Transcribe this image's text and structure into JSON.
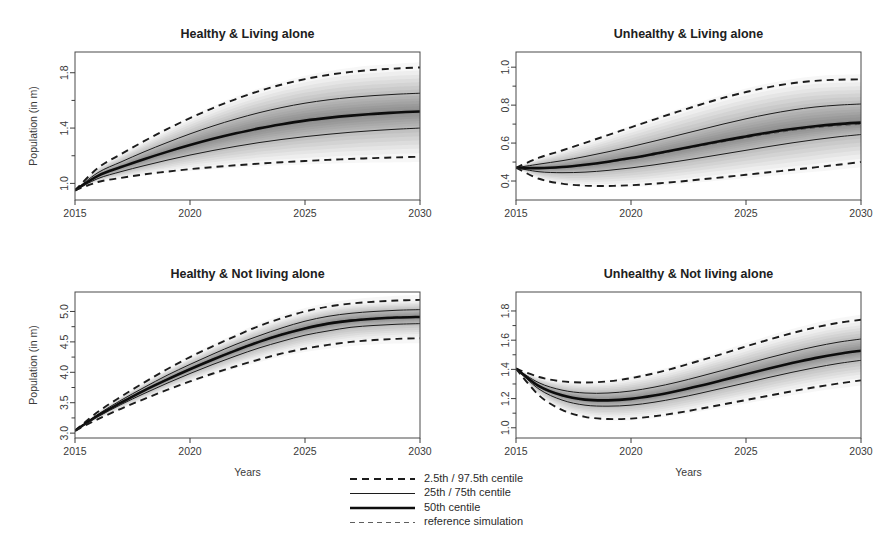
{
  "figure": {
    "width": 884,
    "height": 560,
    "background": "#ffffff",
    "ink": "#1a1a1a"
  },
  "axis_titles": {
    "y": "Population (in m)",
    "x": "Years"
  },
  "legend": {
    "items": [
      {
        "label": "2.5th / 97.5th centile",
        "style": "dashed-bold",
        "color": "#1c1c1c"
      },
      {
        "label": "25th / 75th centile",
        "style": "solid-thin",
        "color": "#1c1c1c"
      },
      {
        "label": "50th centile",
        "style": "solid-bold",
        "color": "#0d0d0d"
      },
      {
        "label": "reference simulation",
        "style": "dashed-thin",
        "color": "#6e6e6e"
      }
    ]
  },
  "chart_data": [
    {
      "id": "healthy-living-alone",
      "type": "line",
      "title": "Healthy & Living alone",
      "xlabel": "",
      "ylabel": "Population (in m)",
      "xlim": [
        2015,
        2030
      ],
      "ylim": [
        0.88,
        1.95
      ],
      "xticks": [
        2015,
        2020,
        2025,
        2030
      ],
      "yticks": [
        1.0,
        1.4,
        1.8
      ],
      "ytick_labels": [
        "1.0",
        "1.4",
        "1.8"
      ],
      "yminor": [
        1.2,
        1.6
      ],
      "grid": false,
      "x": [
        2015,
        2016,
        2017,
        2018,
        2019,
        2020,
        2021,
        2022,
        2023,
        2024,
        2025,
        2026,
        2027,
        2028,
        2029,
        2030
      ],
      "series": [
        {
          "name": "2.5th centile",
          "style": "dashed-bold",
          "values": [
            0.95,
            1.01,
            1.04,
            1.065,
            1.085,
            1.103,
            1.118,
            1.131,
            1.143,
            1.153,
            1.162,
            1.17,
            1.177,
            1.183,
            1.188,
            1.193
          ]
        },
        {
          "name": "25th centile",
          "style": "solid-thin",
          "values": [
            0.95,
            1.035,
            1.085,
            1.128,
            1.168,
            1.205,
            1.238,
            1.268,
            1.295,
            1.318,
            1.338,
            1.355,
            1.37,
            1.382,
            1.392,
            1.4
          ]
        },
        {
          "name": "50th centile",
          "style": "solid-bold",
          "values": [
            0.95,
            1.055,
            1.118,
            1.175,
            1.228,
            1.277,
            1.322,
            1.362,
            1.398,
            1.428,
            1.454,
            1.474,
            1.49,
            1.503,
            1.513,
            1.52
          ]
        },
        {
          "name": "reference simulation",
          "style": "dashed-thin",
          "values": [
            0.95,
            1.055,
            1.119,
            1.176,
            1.229,
            1.278,
            1.323,
            1.363,
            1.399,
            1.429,
            1.455,
            1.475,
            1.491,
            1.504,
            1.514,
            1.521
          ]
        },
        {
          "name": "75th centile",
          "style": "solid-thin",
          "values": [
            0.95,
            1.078,
            1.155,
            1.228,
            1.295,
            1.358,
            1.415,
            1.466,
            1.511,
            1.549,
            1.58,
            1.604,
            1.622,
            1.635,
            1.645,
            1.652
          ]
        },
        {
          "name": "97.5th centile",
          "style": "dashed-bold",
          "values": [
            0.95,
            1.112,
            1.212,
            1.305,
            1.392,
            1.472,
            1.545,
            1.61,
            1.667,
            1.715,
            1.754,
            1.784,
            1.806,
            1.821,
            1.831,
            1.838
          ]
        }
      ]
    },
    {
      "id": "unhealthy-living-alone",
      "type": "line",
      "title": "Unhealthy & Living alone",
      "xlabel": "",
      "ylabel": "",
      "xlim": [
        2015,
        2030
      ],
      "ylim": [
        0.3,
        1.08
      ],
      "xticks": [
        2015,
        2020,
        2025,
        2030
      ],
      "yticks": [
        0.4,
        0.6,
        0.8,
        1.0
      ],
      "ytick_labels": [
        "0.4",
        "0.6",
        "0.8",
        "1.0"
      ],
      "yminor": [
        0.5,
        0.7,
        0.9
      ],
      "grid": false,
      "x": [
        2015,
        2016,
        2017,
        2018,
        2019,
        2020,
        2021,
        2022,
        2023,
        2024,
        2025,
        2026,
        2027,
        2028,
        2029,
        2030
      ],
      "series": [
        {
          "name": "2.5th centile",
          "style": "dashed-bold",
          "values": [
            0.47,
            0.412,
            0.386,
            0.376,
            0.374,
            0.378,
            0.386,
            0.396,
            0.408,
            0.42,
            0.433,
            0.446,
            0.459,
            0.472,
            0.486,
            0.5
          ]
        },
        {
          "name": "25th centile",
          "style": "solid-thin",
          "values": [
            0.47,
            0.449,
            0.444,
            0.447,
            0.456,
            0.469,
            0.485,
            0.503,
            0.522,
            0.542,
            0.562,
            0.582,
            0.601,
            0.618,
            0.633,
            0.645
          ]
        },
        {
          "name": "50th centile",
          "style": "solid-bold",
          "values": [
            0.47,
            0.468,
            0.474,
            0.486,
            0.502,
            0.521,
            0.543,
            0.566,
            0.59,
            0.613,
            0.635,
            0.656,
            0.674,
            0.689,
            0.7,
            0.708
          ]
        },
        {
          "name": "reference simulation",
          "style": "dashed-thin",
          "values": [
            0.47,
            0.467,
            0.472,
            0.483,
            0.498,
            0.517,
            0.538,
            0.561,
            0.584,
            0.606,
            0.628,
            0.648,
            0.666,
            0.68,
            0.691,
            0.699
          ]
        },
        {
          "name": "75th centile",
          "style": "solid-thin",
          "values": [
            0.47,
            0.489,
            0.507,
            0.529,
            0.554,
            0.581,
            0.61,
            0.64,
            0.67,
            0.7,
            0.728,
            0.753,
            0.774,
            0.79,
            0.8,
            0.806
          ]
        },
        {
          "name": "97.5th centile",
          "style": "dashed-bold",
          "values": [
            0.47,
            0.523,
            0.561,
            0.601,
            0.642,
            0.683,
            0.724,
            0.764,
            0.802,
            0.838,
            0.869,
            0.895,
            0.915,
            0.928,
            0.934,
            0.936
          ]
        }
      ]
    },
    {
      "id": "healthy-not-living-alone",
      "type": "line",
      "title": "Healthy & Not living alone",
      "xlabel": "Years",
      "ylabel": "Population (in m)",
      "xlim": [
        2015,
        2030
      ],
      "ylim": [
        2.92,
        5.32
      ],
      "xticks": [
        2015,
        2020,
        2025,
        2030
      ],
      "yticks": [
        3.0,
        3.5,
        4.0,
        4.5,
        5.0
      ],
      "ytick_labels": [
        "3.0",
        "3.5",
        "4.0",
        "4.5",
        "5.0"
      ],
      "yminor": [
        3.25,
        3.75,
        4.25,
        4.75
      ],
      "grid": false,
      "x": [
        2015,
        2016,
        2017,
        2018,
        2019,
        2020,
        2021,
        2022,
        2023,
        2024,
        2025,
        2026,
        2027,
        2028,
        2029,
        2030
      ],
      "series": [
        {
          "name": "2.5th centile",
          "style": "dashed-bold",
          "values": [
            3.04,
            3.23,
            3.4,
            3.56,
            3.71,
            3.85,
            3.98,
            4.1,
            4.21,
            4.31,
            4.39,
            4.45,
            4.5,
            4.53,
            4.55,
            4.56
          ]
        },
        {
          "name": "25th centile",
          "style": "solid-thin",
          "values": [
            3.04,
            3.27,
            3.47,
            3.65,
            3.82,
            3.98,
            4.13,
            4.27,
            4.4,
            4.51,
            4.61,
            4.68,
            4.74,
            4.77,
            4.79,
            4.8
          ]
        },
        {
          "name": "50th centile",
          "style": "solid-bold",
          "values": [
            3.04,
            3.29,
            3.5,
            3.7,
            3.88,
            4.05,
            4.21,
            4.36,
            4.5,
            4.62,
            4.72,
            4.8,
            4.85,
            4.88,
            4.9,
            4.91
          ]
        },
        {
          "name": "reference simulation",
          "style": "dashed-thin",
          "values": [
            3.04,
            3.29,
            3.51,
            3.71,
            3.89,
            4.06,
            4.22,
            4.37,
            4.51,
            4.63,
            4.73,
            4.81,
            4.86,
            4.89,
            4.91,
            4.92
          ]
        },
        {
          "name": "75th centile",
          "style": "solid-thin",
          "values": [
            3.04,
            3.31,
            3.54,
            3.75,
            3.95,
            4.13,
            4.3,
            4.46,
            4.6,
            4.73,
            4.84,
            4.92,
            4.97,
            5.0,
            5.02,
            5.03
          ]
        },
        {
          "name": "97.5th centile",
          "style": "dashed-bold",
          "values": [
            3.04,
            3.35,
            3.6,
            3.83,
            4.05,
            4.25,
            4.43,
            4.6,
            4.76,
            4.89,
            5.0,
            5.08,
            5.13,
            5.16,
            5.18,
            5.19
          ]
        }
      ]
    },
    {
      "id": "unhealthy-not-living-alone",
      "type": "line",
      "title": "Unhealthy & Not living alone",
      "xlabel": "Years",
      "ylabel": "",
      "xlim": [
        2015,
        2030
      ],
      "ylim": [
        0.93,
        1.93
      ],
      "xticks": [
        2015,
        2020,
        2025,
        2030
      ],
      "yticks": [
        1.0,
        1.2,
        1.4,
        1.6,
        1.8
      ],
      "ytick_labels": [
        "1.0",
        "1.2",
        "1.4",
        "1.6",
        "1.8"
      ],
      "yminor": [
        1.1,
        1.3,
        1.5,
        1.7
      ],
      "grid": false,
      "x": [
        2015,
        2016,
        2017,
        2018,
        2019,
        2020,
        2021,
        2022,
        2023,
        2024,
        2025,
        2026,
        2027,
        2028,
        2029,
        2030
      ],
      "series": [
        {
          "name": "2.5th centile",
          "style": "dashed-bold",
          "values": [
            1.405,
            1.222,
            1.122,
            1.075,
            1.06,
            1.063,
            1.079,
            1.102,
            1.13,
            1.16,
            1.19,
            1.22,
            1.25,
            1.278,
            1.303,
            1.325
          ]
        },
        {
          "name": "25th centile",
          "style": "solid-thin",
          "values": [
            1.405,
            1.265,
            1.19,
            1.155,
            1.148,
            1.155,
            1.175,
            1.203,
            1.236,
            1.272,
            1.308,
            1.345,
            1.38,
            1.412,
            1.44,
            1.462
          ]
        },
        {
          "name": "50th centile",
          "style": "solid-bold",
          "values": [
            1.405,
            1.285,
            1.222,
            1.193,
            1.188,
            1.198,
            1.221,
            1.252,
            1.288,
            1.327,
            1.367,
            1.406,
            1.443,
            1.477,
            1.505,
            1.528
          ]
        },
        {
          "name": "reference simulation",
          "style": "dashed-thin",
          "values": [
            1.405,
            1.283,
            1.22,
            1.191,
            1.187,
            1.197,
            1.22,
            1.251,
            1.287,
            1.326,
            1.366,
            1.405,
            1.442,
            1.476,
            1.504,
            1.527
          ]
        },
        {
          "name": "75th centile",
          "style": "solid-thin",
          "values": [
            1.405,
            1.308,
            1.258,
            1.238,
            1.238,
            1.252,
            1.278,
            1.312,
            1.352,
            1.394,
            1.437,
            1.48,
            1.52,
            1.556,
            1.586,
            1.608
          ]
        },
        {
          "name": "97.5th centile",
          "style": "dashed-bold",
          "values": [
            1.405,
            1.348,
            1.318,
            1.31,
            1.318,
            1.34,
            1.373,
            1.414,
            1.46,
            1.508,
            1.557,
            1.604,
            1.648,
            1.687,
            1.718,
            1.74
          ]
        }
      ]
    }
  ]
}
